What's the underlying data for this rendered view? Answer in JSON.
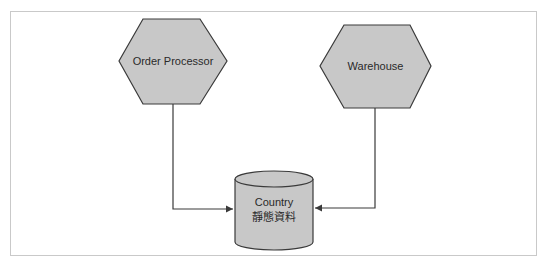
{
  "diagram": {
    "nodes": [
      {
        "id": "order-processor",
        "shape": "hexagon",
        "label": "Order Processor"
      },
      {
        "id": "warehouse",
        "shape": "hexagon",
        "label": "Warehouse"
      },
      {
        "id": "country-store",
        "shape": "cylinder",
        "label_line1": "Country",
        "label_line2": "靜態資料"
      }
    ],
    "edges": [
      {
        "from": "order-processor",
        "to": "country-store",
        "arrow": "end"
      },
      {
        "from": "warehouse",
        "to": "country-store",
        "arrow": "end"
      }
    ],
    "colors": {
      "node_fill": "#c8c8c8",
      "node_stroke": "#3a3a3a",
      "edge": "#3a3a3a",
      "frame_border": "#c9c9c9"
    }
  }
}
